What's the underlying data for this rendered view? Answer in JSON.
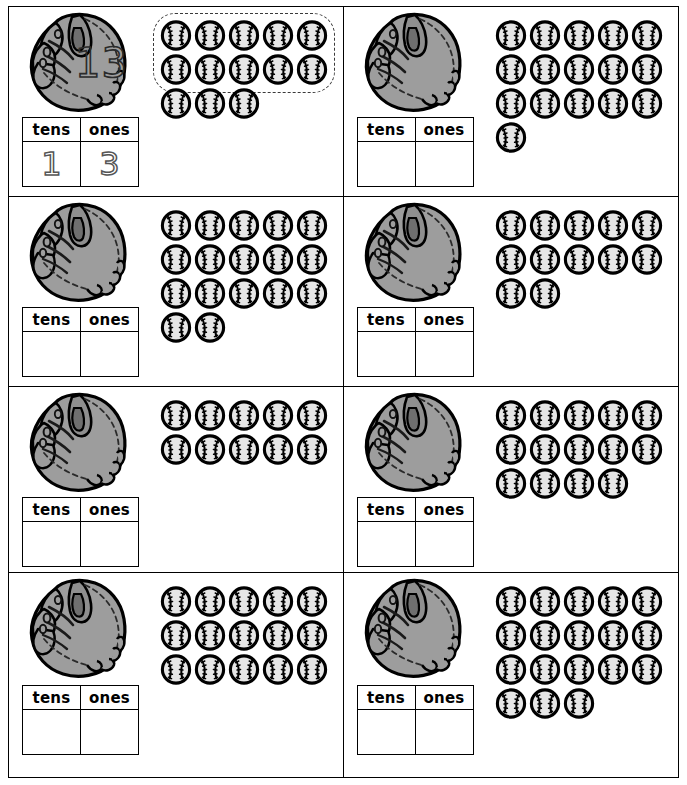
{
  "worksheet": {
    "title": "Place Value with Baseballs",
    "table_headers": {
      "tens": "tens",
      "ones": "ones"
    },
    "icons": {
      "glove": "baseball-glove-icon",
      "ball": "baseball-icon",
      "loop": "dashed-group-of-ten-loop"
    }
  },
  "problems": [
    {
      "id": 1,
      "example": true,
      "glove_label": "13",
      "total_balls": 13,
      "ball_rows": [
        5,
        5,
        3
      ],
      "grouped_of_ten": true,
      "tens": "1",
      "ones": "3"
    },
    {
      "id": 2,
      "example": false,
      "glove_label": "",
      "total_balls": 16,
      "ball_rows": [
        5,
        5,
        5,
        1
      ],
      "grouped_of_ten": false,
      "tens": "",
      "ones": ""
    },
    {
      "id": 3,
      "example": false,
      "glove_label": "",
      "total_balls": 17,
      "ball_rows": [
        5,
        5,
        5,
        2
      ],
      "grouped_of_ten": false,
      "tens": "",
      "ones": ""
    },
    {
      "id": 4,
      "example": false,
      "glove_label": "",
      "total_balls": 12,
      "ball_rows": [
        5,
        5,
        2
      ],
      "grouped_of_ten": false,
      "tens": "",
      "ones": ""
    },
    {
      "id": 5,
      "example": false,
      "glove_label": "",
      "total_balls": 10,
      "ball_rows": [
        5,
        5
      ],
      "grouped_of_ten": false,
      "tens": "",
      "ones": ""
    },
    {
      "id": 6,
      "example": false,
      "glove_label": "",
      "total_balls": 14,
      "ball_rows": [
        5,
        5,
        4
      ],
      "grouped_of_ten": false,
      "tens": "",
      "ones": ""
    },
    {
      "id": 7,
      "example": false,
      "glove_label": "",
      "total_balls": 15,
      "ball_rows": [
        5,
        5,
        5
      ],
      "grouped_of_ten": false,
      "tens": "",
      "ones": ""
    },
    {
      "id": 8,
      "example": false,
      "glove_label": "",
      "total_balls": 18,
      "ball_rows": [
        5,
        5,
        5,
        3
      ],
      "grouped_of_ten": false,
      "tens": "",
      "ones": ""
    }
  ],
  "colors": {
    "ink": "#000000",
    "glove_fill": "#9d9d9d",
    "glove_shade": "#8a8a8a",
    "ball_fill": "#e6e6e6",
    "page": "#ffffff",
    "traced": "#555555"
  }
}
